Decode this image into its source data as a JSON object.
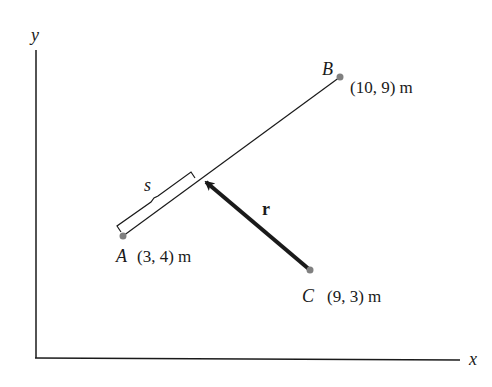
{
  "diagram": {
    "type": "vector-geometry",
    "axes": {
      "x_label": "x",
      "y_label": "y"
    },
    "points": {
      "A": {
        "name": "A",
        "coords": "(3, 4) m"
      },
      "B": {
        "name": "B",
        "coords": "(10, 9) m"
      },
      "C": {
        "name": "C",
        "coords": "(9, 3) m"
      }
    },
    "segment_label": "s",
    "vector_label": "r",
    "colors": {
      "line": "#1a1a1a",
      "point": "#808080",
      "background": "#ffffff"
    }
  }
}
